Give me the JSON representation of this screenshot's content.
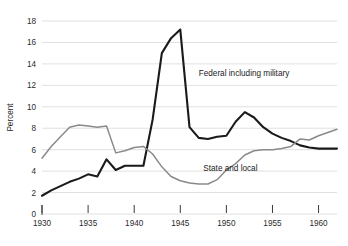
{
  "chart_data": {
    "type": "line",
    "title": "",
    "subtitle": "",
    "xlabel": "",
    "ylabel": "Percent",
    "xlim": [
      1930,
      1962
    ],
    "ylim": [
      0,
      18
    ],
    "ytick_values": [
      0,
      2,
      4,
      6,
      8,
      10,
      12,
      14,
      16,
      18
    ],
    "ytick_labels": [
      "0",
      "2",
      "4",
      "6",
      "8",
      "10",
      "12",
      "14",
      "16",
      "18"
    ],
    "xtick_values": [
      1930,
      1935,
      1940,
      1945,
      1950,
      1955,
      1960
    ],
    "xtick_labels": [
      "1930",
      "1935",
      "1940",
      "1945",
      "1950",
      "1955",
      "1960"
    ],
    "grid": true,
    "grid_axis": "y",
    "legend_position": "inline-annotation",
    "x": [
      1930,
      1931,
      1932,
      1933,
      1934,
      1935,
      1936,
      1937,
      1938,
      1939,
      1940,
      1941,
      1942,
      1943,
      1944,
      1945,
      1946,
      1947,
      1948,
      1949,
      1950,
      1951,
      1952,
      1953,
      1954,
      1955,
      1956,
      1957,
      1958,
      1959,
      1960,
      1961,
      1962
    ],
    "series": [
      {
        "name": "Federal including military",
        "color": "#1a1a1a",
        "width": 2.1,
        "values": [
          1.7,
          2.2,
          2.6,
          3.0,
          3.3,
          3.7,
          3.5,
          5.1,
          4.1,
          4.5,
          4.5,
          4.5,
          8.8,
          15.0,
          16.4,
          17.2,
          8.1,
          7.1,
          7.0,
          7.2,
          7.3,
          8.6,
          9.5,
          9.0,
          8.1,
          7.5,
          7.1,
          6.8,
          6.4,
          6.2,
          6.1,
          6.1,
          6.1
        ]
      },
      {
        "name": "State and local",
        "color": "#8a8a8a",
        "width": 1.5,
        "values": [
          5.2,
          6.3,
          7.2,
          8.1,
          8.3,
          8.2,
          8.1,
          8.2,
          5.7,
          5.9,
          6.2,
          6.3,
          5.6,
          4.4,
          3.5,
          3.1,
          2.9,
          2.8,
          2.8,
          3.2,
          4.1,
          4.7,
          5.5,
          5.9,
          6.0,
          6.0,
          6.1,
          6.3,
          7.0,
          6.9,
          7.3,
          7.6,
          7.9
        ]
      }
    ],
    "annotations": [
      {
        "text": "Federal including military",
        "x": 1947.0,
        "y": 12.9
      },
      {
        "text": "State and local",
        "x": 1947.5,
        "y": 4.0
      }
    ]
  }
}
